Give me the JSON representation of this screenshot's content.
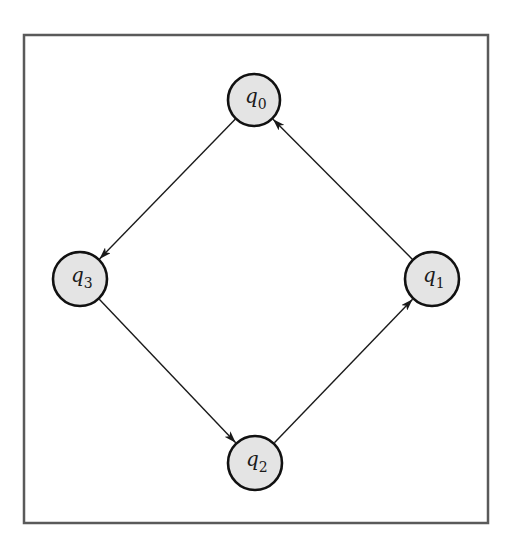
{
  "diagram": {
    "type": "state-transition-cycle",
    "frame": {
      "x": 24,
      "y": 35,
      "width": 464,
      "height": 488
    },
    "nodes": [
      {
        "id": "q0",
        "base": "q",
        "sub": "0",
        "cx": 254,
        "cy": 100,
        "r": 26
      },
      {
        "id": "q1",
        "base": "q",
        "sub": "1",
        "cx": 432,
        "cy": 279,
        "r": 27
      },
      {
        "id": "q2",
        "base": "q",
        "sub": "2",
        "cx": 255,
        "cy": 463,
        "r": 27
      },
      {
        "id": "q3",
        "base": "q",
        "sub": "3",
        "cx": 80,
        "cy": 279,
        "r": 27
      }
    ],
    "edges": [
      {
        "from": "q0",
        "to": "q3"
      },
      {
        "from": "q3",
        "to": "q2"
      },
      {
        "from": "q2",
        "to": "q1"
      },
      {
        "from": "q1",
        "to": "q0"
      }
    ],
    "colors": {
      "node_fill": "#e4e4e4",
      "node_stroke": "#111111",
      "edge": "#1a1a1a",
      "frame": "#5a5a5a"
    }
  }
}
